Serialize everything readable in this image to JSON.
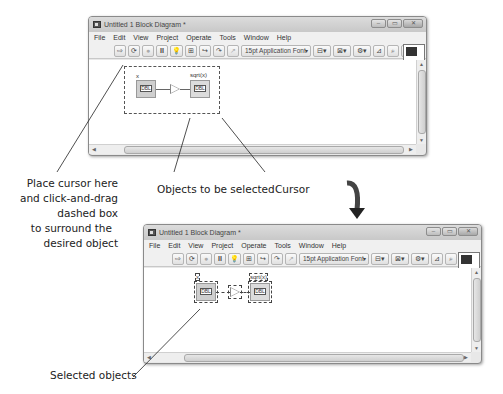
{
  "window_top": {
    "title": "Untitled 1 Block Diagram *",
    "menu": [
      "File",
      "Edit",
      "View",
      "Project",
      "Operate",
      "Tools",
      "Window",
      "Help"
    ],
    "toolbar": {
      "font_select": "15pt Application Font",
      "buttons": [
        "run-arrow-icon",
        "run-continuous-icon",
        "abort-icon",
        "pause-icon",
        "highlight-execution-icon",
        "retain-wire-values-icon",
        "step-into-icon",
        "step-over-icon",
        "step-out-icon",
        "align-objects-icon",
        "distribute-objects-icon",
        "reorder-icon",
        "clean-up-diagram-icon",
        "search-icon",
        "help-icon"
      ]
    },
    "window_controls": [
      "minimize",
      "maximize",
      "close"
    ],
    "diagram": {
      "control_label": "x",
      "control_value": "DBL",
      "indicator_label": "sqrt(x)",
      "indicator_value": "DBL",
      "function": "square-root"
    },
    "vi_icon_number": "1"
  },
  "window_bottom": {
    "title": "Untitled 1 Block Diagram *",
    "menu": [
      "File",
      "Edit",
      "View",
      "Project",
      "Operate",
      "Tools",
      "Window",
      "Help"
    ],
    "toolbar": {
      "font_select": "15pt Application Font"
    },
    "diagram": {
      "control_label": "x",
      "control_value": "DBL",
      "indicator_label": "sqrt(x)",
      "indicator_value": "DBL",
      "selected": true
    },
    "vi_icon_number": "1"
  },
  "annotations": {
    "place_cursor": [
      "Place cursor here",
      "and click-and-drag",
      "dashed box",
      "to surround the",
      "desired object"
    ],
    "objects_to_select": "Objects to be selected",
    "cursor": "Cursor",
    "selected_objects": "Selected objects"
  },
  "colors": {
    "arrow": "#333333",
    "window_frame": "#8a8a8a",
    "node_fill": "#cfcfcf"
  }
}
